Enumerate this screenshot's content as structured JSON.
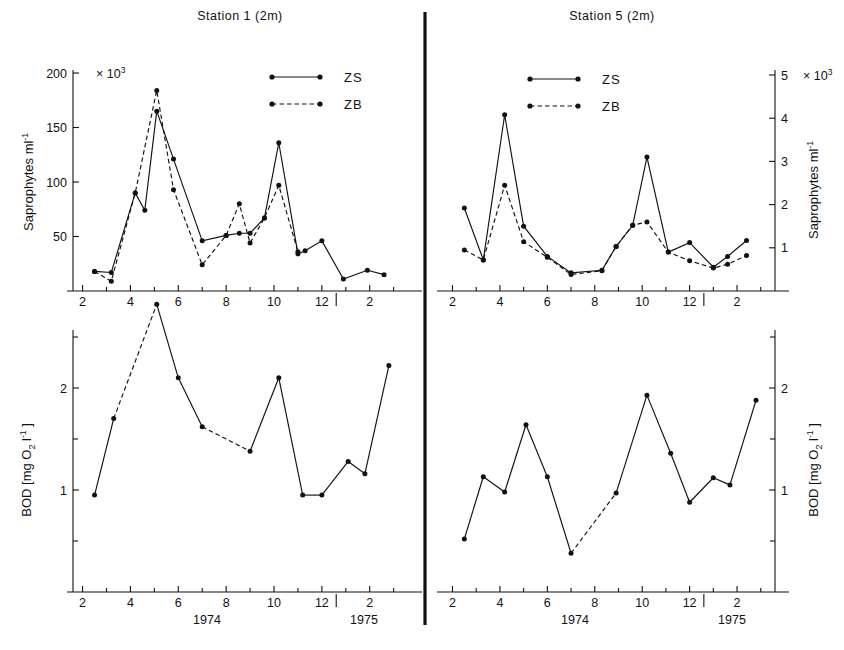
{
  "figure": {
    "panels": [
      {
        "id": "station1-saprophytes",
        "title": "Station 1  (2m)",
        "ylabel": "Saprophytes   ml",
        "ylabel_sup": "-1",
        "multiplier": "× 10",
        "multiplier_sup": "3",
        "legend": [
          {
            "label": "ZS",
            "style": "solid"
          },
          {
            "label": "ZB",
            "style": "dashed"
          }
        ]
      },
      {
        "id": "station5-saprophytes",
        "title": "Station 5  (2m)",
        "ylabel": "Saprophytes   ml",
        "ylabel_sup": "-1",
        "multiplier": "× 10",
        "multiplier_sup": "3",
        "legend": [
          {
            "label": "ZS",
            "style": "solid"
          },
          {
            "label": "ZB",
            "style": "dashed"
          }
        ]
      },
      {
        "id": "station1-bod",
        "ylabel_parts": [
          "BOD   [mg O",
          "2",
          " l",
          "-1",
          " ]"
        ]
      },
      {
        "id": "station5-bod",
        "ylabel_parts": [
          "BOD   [mg O",
          "2",
          " l",
          "-1",
          " ]"
        ]
      }
    ],
    "year_labels": [
      "1974",
      "1975"
    ],
    "month_ticks": [
      "2",
      "4",
      "6",
      "8",
      "10",
      "12",
      "2"
    ]
  },
  "chart_data": [
    {
      "type": "line",
      "id": "station1-saprophytes",
      "title": "Station 1  (2m)",
      "xlabel": "",
      "ylabel": "Saprophytes ml^-1",
      "y_unit_multiplier": 1000,
      "ylim": [
        0,
        200
      ],
      "yticks": [
        50,
        100,
        150,
        200
      ],
      "ytick_labels": [
        "50",
        "100",
        "150",
        "200"
      ],
      "xlim": [
        1.6,
        15.6
      ],
      "xticks": [
        2,
        4,
        6,
        8,
        10,
        12,
        14
      ],
      "xtick_labels": [
        "2",
        "4",
        "6",
        "8",
        "10",
        "12",
        "2"
      ],
      "year_break_at": 12.6,
      "grid": false,
      "legend_position": "top-right",
      "series": [
        {
          "name": "ZS",
          "style": "solid",
          "x": [
            2.5,
            3.2,
            4.2,
            4.6,
            5.1,
            5.8,
            7.0,
            8.0,
            8.55,
            9.0,
            9.6,
            10.2,
            11.0,
            11.3,
            12.0,
            12.9,
            13.9,
            14.6
          ],
          "y": [
            18,
            17,
            90,
            74,
            165,
            121,
            46,
            51,
            53,
            53,
            67,
            136,
            34,
            37,
            46,
            11,
            19,
            15
          ]
        },
        {
          "name": "ZB",
          "style": "dashed",
          "x": [
            2.5,
            3.2,
            4.2,
            5.1,
            5.8,
            7.0,
            8.0,
            8.55,
            9.0,
            9.6,
            10.2,
            11.0
          ],
          "y": [
            18,
            9,
            90,
            184,
            93,
            24,
            51,
            80,
            44,
            67,
            97,
            36
          ]
        }
      ]
    },
    {
      "type": "line",
      "id": "station5-saprophytes",
      "title": "Station 5  (2m)",
      "xlabel": "",
      "ylabel": "Saprophytes ml^-1",
      "y_unit_multiplier": 1000,
      "ylim": [
        0,
        5.4
      ],
      "yticks": [
        1,
        2,
        3,
        4,
        5
      ],
      "ytick_labels": [
        "1",
        "2",
        "3",
        "4",
        "5"
      ],
      "xlim": [
        1.6,
        15.6
      ],
      "xticks": [
        2,
        4,
        6,
        8,
        10,
        12,
        14
      ],
      "xtick_labels": [
        "2",
        "4",
        "6",
        "8",
        "10",
        "12",
        "2"
      ],
      "year_break_at": 12.6,
      "grid": false,
      "legend_position": "top-center",
      "series": [
        {
          "name": "ZS",
          "style": "solid",
          "x": [
            2.5,
            3.3,
            4.2,
            5.0,
            6.0,
            7.0,
            8.3,
            8.9,
            9.6,
            10.2,
            11.1,
            12.0,
            13.0,
            13.6,
            14.4
          ],
          "y": [
            1.92,
            0.72,
            4.08,
            1.5,
            0.8,
            0.42,
            0.48,
            1.03,
            1.52,
            3.1,
            0.9,
            1.12,
            0.55,
            0.8,
            1.17
          ]
        },
        {
          "name": "ZB",
          "style": "dashed",
          "x": [
            2.5,
            3.3,
            4.2,
            5.0,
            6.0,
            7.0,
            8.3,
            8.9,
            9.6,
            10.2,
            11.1,
            12.0,
            13.0,
            13.6,
            14.4
          ],
          "y": [
            0.95,
            0.72,
            2.45,
            1.14,
            0.78,
            0.38,
            0.47,
            1.03,
            1.52,
            1.6,
            0.9,
            0.7,
            0.53,
            0.62,
            0.82
          ]
        }
      ]
    },
    {
      "type": "line",
      "id": "station1-bod",
      "title": "",
      "xlabel": "1974 / 1975",
      "ylabel": "BOD [mg O2 l^-1]",
      "ylim": [
        0,
        2.95
      ],
      "yticks": [
        1,
        2
      ],
      "ytick_labels": [
        "1",
        "2"
      ],
      "yminor": [
        0.5,
        1.5,
        2.5
      ],
      "xlim": [
        1.6,
        15.6
      ],
      "xticks": [
        2,
        4,
        6,
        8,
        10,
        12,
        14
      ],
      "xtick_labels": [
        "2",
        "4",
        "6",
        "8",
        "10",
        "12",
        "2"
      ],
      "year_break_at": 12.6,
      "grid": false,
      "legend_position": "none",
      "series": [
        {
          "name": "BOD",
          "style": "mixed",
          "x": [
            2.5,
            3.3,
            5.1,
            6.0,
            7.0,
            9.0,
            10.2,
            11.2,
            12.0,
            13.1,
            13.8,
            14.8
          ],
          "y": [
            0.95,
            1.7,
            2.82,
            2.1,
            1.62,
            1.38,
            2.1,
            0.95,
            0.95,
            1.28,
            1.16,
            2.22
          ],
          "dashed_segments": [
            [
              1,
              2
            ],
            [
              4,
              5
            ]
          ]
        }
      ]
    },
    {
      "type": "line",
      "id": "station5-bod",
      "title": "",
      "xlabel": "1974 / 1975",
      "ylabel": "BOD [mg O2 l^-1]",
      "ylim": [
        0,
        2.95
      ],
      "yticks": [
        1,
        2
      ],
      "ytick_labels": [
        "1",
        "2"
      ],
      "yminor": [
        0.5,
        1.5,
        2.5
      ],
      "xlim": [
        1.6,
        15.6
      ],
      "xticks": [
        2,
        4,
        6,
        8,
        10,
        12,
        14
      ],
      "xtick_labels": [
        "2",
        "4",
        "6",
        "8",
        "10",
        "12",
        "2"
      ],
      "year_break_at": 12.6,
      "grid": false,
      "legend_position": "none",
      "series": [
        {
          "name": "BOD",
          "style": "mixed",
          "x": [
            2.5,
            3.3,
            4.2,
            5.1,
            6.0,
            7.0,
            8.9,
            10.2,
            11.2,
            12.0,
            13.0,
            13.7,
            14.8
          ],
          "y": [
            0.52,
            1.13,
            0.98,
            1.64,
            1.13,
            0.38,
            0.97,
            1.93,
            1.36,
            0.88,
            1.12,
            1.05,
            1.88
          ],
          "dashed_segments": [
            [
              5,
              6
            ]
          ]
        }
      ]
    }
  ]
}
